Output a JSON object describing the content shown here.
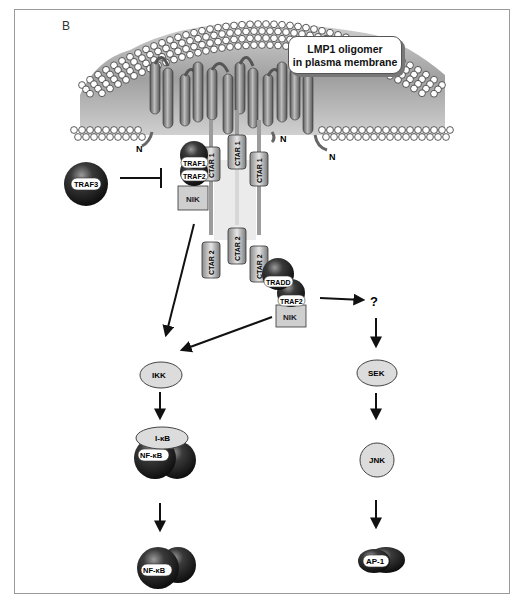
{
  "figure": {
    "panel_label": "B",
    "callout": {
      "line1": "LMP1 oligomer",
      "line2": "in plasma membrane"
    },
    "membrane": {
      "terminus_labels": [
        "N",
        "N",
        "N"
      ]
    },
    "ctar_domains": {
      "ctar1": [
        "CTAR 1",
        "CTAR 1",
        "CTAR 1"
      ],
      "ctar2": [
        "CTAR 2",
        "CTAR 2",
        "CTAR 2"
      ]
    },
    "left_complex": {
      "traf1": "TRAF1",
      "traf2": "TRAF2",
      "nik": "NIK"
    },
    "inhibitor": {
      "label": "TRAF3",
      "relation": "inhibits"
    },
    "right_complex": {
      "tradd": "TRADD",
      "traf2": "TRAF2",
      "nik": "NIK"
    },
    "unknown_node": "?",
    "nfkb_pathway": {
      "ikk": "IKK",
      "ikb": "I-κB",
      "nfkb_bound": "NF-κB",
      "nfkb_free": "NF-κB"
    },
    "jnk_pathway": {
      "sek": "SEK",
      "jnk": "JNK",
      "ap1": "AP-1"
    },
    "colors": {
      "membrane_head": "#ffffff",
      "membrane_tail": "#b8b8b8",
      "helix": "#8c8c8c",
      "kinase_fill": "#dcdcdc",
      "dark_protein": "#2a2a2a",
      "arrow": "#111111",
      "frame": "#9a9a9a"
    }
  }
}
